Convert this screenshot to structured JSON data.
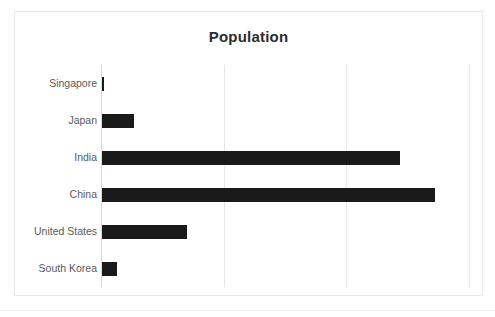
{
  "chart_data": {
    "type": "bar",
    "orientation": "horizontal",
    "title": "Population",
    "xlabel": "",
    "ylabel": "",
    "categories": [
      "Singapore",
      "Japan",
      "India",
      "China",
      "United States",
      "South Korea"
    ],
    "values": [
      6,
      126,
      1380,
      1440,
      331,
      52
    ],
    "value_unit": "millions",
    "xlim": [
      0,
      1500
    ],
    "xticks": [
      0,
      500,
      1000,
      1500
    ],
    "xtick_labels": [
      "",
      "",
      "",
      ""
    ],
    "grid": true,
    "grid_axis": "x",
    "legend": false,
    "legend_position": "none",
    "bar_color": "#1a1a1a",
    "gridline_color": "#e6e6e6",
    "label_color": "#5a5a5a",
    "title_color": "#2d2d2d",
    "plot_background": "#ffffff",
    "border_color": "#e8e8e8",
    "bar_pixel_lengths": [
      2,
      32,
      298,
      333,
      85,
      15
    ],
    "plot_pixel_width": 368
  },
  "frame": {
    "title": "Population"
  }
}
